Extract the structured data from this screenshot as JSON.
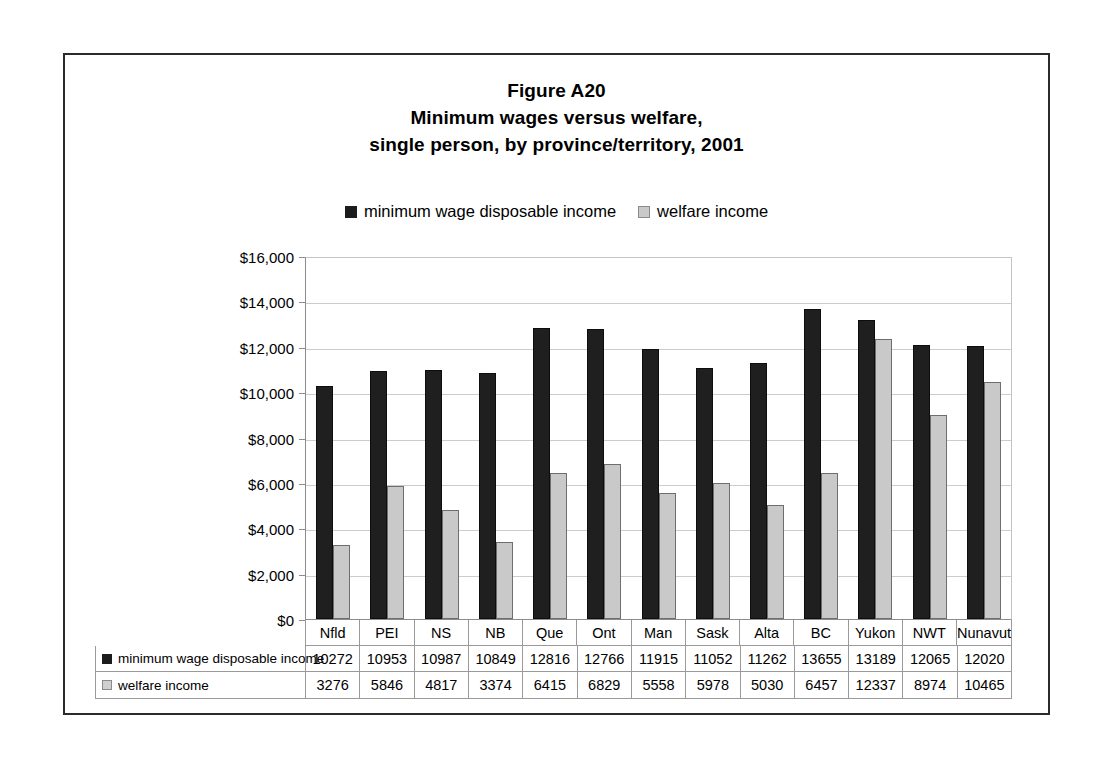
{
  "figure": {
    "title_lines": [
      "Figure A20",
      "Minimum wages versus welfare,",
      "single person, by province/territory, 2001"
    ]
  },
  "chart_data": {
    "type": "bar",
    "title": "Figure A20 Minimum wages versus welfare, single person, by province/territory, 2001",
    "xlabel": "",
    "ylabel": "",
    "ylim": [
      0,
      16000
    ],
    "ytick_labels": [
      "$16,000",
      "$14,000",
      "$12,000",
      "$10,000",
      "$8,000",
      "$6,000",
      "$4,000",
      "$2,000",
      "$0"
    ],
    "ytick_values": [
      16000,
      14000,
      12000,
      10000,
      8000,
      6000,
      4000,
      2000,
      0
    ],
    "grid": true,
    "legend_position": "top-center",
    "categories": [
      "Nfld",
      "PEI",
      "NS",
      "NB",
      "Que",
      "Ont",
      "Man",
      "Sask",
      "Alta",
      "BC",
      "Yukon",
      "NWT",
      "Nunavut"
    ],
    "series": [
      {
        "name": "minimum wage disposable income",
        "color": "#1f1f1f",
        "values": [
          10272,
          10953,
          10987,
          10849,
          12816,
          12766,
          11915,
          11052,
          11262,
          13655,
          13189,
          12065,
          12020
        ]
      },
      {
        "name": "welfare income",
        "color": "#c9c9c9",
        "values": [
          3276,
          5846,
          4817,
          3374,
          6415,
          6829,
          5558,
          5978,
          5030,
          6457,
          12337,
          8974,
          10465
        ]
      }
    ]
  },
  "legend": {
    "entries": [
      {
        "label": "minimum wage disposable income",
        "swatch": "dark"
      },
      {
        "label": "welfare income",
        "swatch": "light"
      }
    ]
  },
  "data_table": {
    "rows": [
      {
        "label": "minimum wage disposable income",
        "swatch": "dark",
        "values": [
          "10272",
          "10953",
          "10987",
          "10849",
          "12816",
          "12766",
          "11915",
          "11052",
          "11262",
          "13655",
          "13189",
          "12065",
          "12020"
        ]
      },
      {
        "label": "welfare income",
        "swatch": "light",
        "values": [
          "3276",
          "5846",
          "4817",
          "3374",
          "6415",
          "6829",
          "5558",
          "5978",
          "5030",
          "6457",
          "12337",
          "8974",
          "10465"
        ]
      }
    ]
  }
}
